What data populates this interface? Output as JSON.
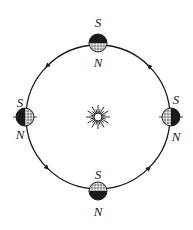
{
  "diagram": {
    "title": "",
    "center_body": {
      "name": "sun",
      "icon": "sun-icon"
    },
    "orbit": {
      "direction": "counterclockwise",
      "arrow_count": 4
    },
    "positions": [
      {
        "id": "top",
        "label_top": "S",
        "label_bottom": "N",
        "dark_half": "top"
      },
      {
        "id": "left",
        "label_top": "S",
        "label_bottom": "N",
        "dark_half": "left"
      },
      {
        "id": "right",
        "label_top": "S",
        "label_bottom": "N",
        "dark_half": "right"
      },
      {
        "id": "bottom",
        "label_top": "S",
        "label_bottom": "N",
        "dark_half": "bottom"
      }
    ],
    "colors": {
      "ink": "#1a1a1a",
      "background": "#ffffff"
    }
  }
}
